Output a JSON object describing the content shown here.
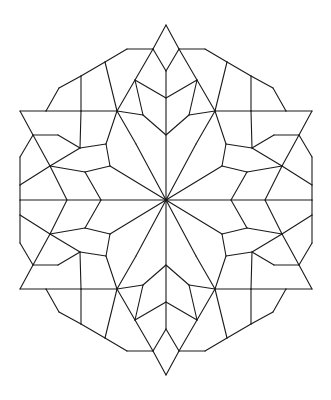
{
  "figure": {
    "stroke_color": "#1a1a1a",
    "background": "#ffffff",
    "center": [
      166,
      200
    ],
    "quadrant_segments": [
      [
        166,
        25,
        153,
        49
      ],
      [
        153,
        49,
        166,
        71
      ],
      [
        166,
        71,
        166,
        200
      ],
      [
        153,
        49,
        127,
        49
      ],
      [
        127,
        49,
        105,
        62
      ],
      [
        105,
        62,
        81,
        76
      ],
      [
        81,
        76,
        59,
        88
      ],
      [
        59,
        88,
        46,
        111
      ],
      [
        46,
        111,
        20,
        111
      ],
      [
        20,
        111,
        33,
        135
      ],
      [
        33,
        135,
        20,
        157
      ],
      [
        20,
        157,
        20,
        185
      ],
      [
        20,
        185,
        20,
        200
      ],
      [
        153,
        49,
        135,
        80
      ],
      [
        135,
        80,
        166,
        98
      ],
      [
        135,
        80,
        143,
        115
      ],
      [
        143,
        115,
        166,
        135
      ],
      [
        105,
        62,
        117,
        111
      ],
      [
        117,
        111,
        135,
        80
      ],
      [
        81,
        76,
        81,
        111
      ],
      [
        81,
        111,
        46,
        111
      ],
      [
        81,
        111,
        117,
        111
      ],
      [
        117,
        111,
        143,
        115
      ],
      [
        117,
        111,
        136,
        144
      ],
      [
        136,
        144,
        166,
        200
      ],
      [
        81,
        111,
        80,
        148
      ],
      [
        80,
        148,
        106,
        144
      ],
      [
        106,
        144,
        117,
        111
      ],
      [
        80,
        148,
        50,
        166
      ],
      [
        50,
        166,
        33,
        135
      ],
      [
        33,
        135,
        58,
        135
      ],
      [
        58,
        135,
        80,
        148
      ],
      [
        106,
        144,
        110,
        166
      ],
      [
        110,
        166,
        166,
        200
      ],
      [
        50,
        166,
        85,
        172
      ],
      [
        85,
        172,
        110,
        166
      ],
      [
        50,
        166,
        20,
        185
      ],
      [
        50,
        166,
        67,
        200
      ],
      [
        85,
        172,
        101,
        200
      ],
      [
        20,
        200,
        166,
        200
      ]
    ]
  }
}
